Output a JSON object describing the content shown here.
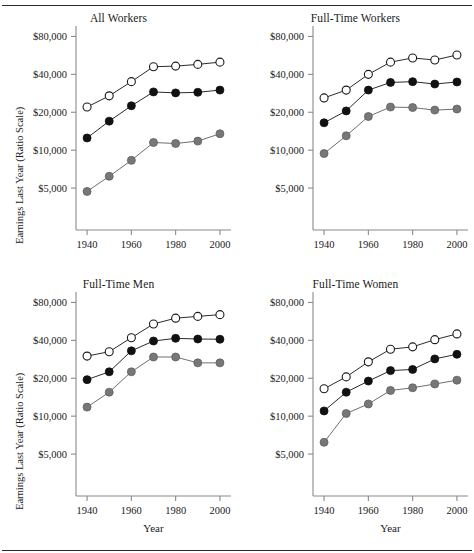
{
  "figure": {
    "ylabel": "Earnings Last Year (Ratio Scale)",
    "xlabel": "Year"
  },
  "chart_data": [
    {
      "type": "line",
      "panel": "top-left",
      "title": "All Workers",
      "xlabel": "",
      "ylabel": "Earnings Last Year (Ratio Scale)",
      "scale": "log",
      "grid": false,
      "legend": "none",
      "x": [
        1940,
        1950,
        1960,
        1970,
        1980,
        1990,
        2000
      ],
      "xlim": [
        1935,
        2005
      ],
      "xticks": [
        1940,
        1960,
        1980,
        2000
      ],
      "xticklabels": [
        "1940",
        "1960",
        "1980",
        "2000"
      ],
      "ylim": [
        3000,
        90000
      ],
      "yticks": [
        5000,
        10000,
        20000,
        40000,
        80000
      ],
      "yticklabels": [
        "$5,000",
        "$10,000",
        "$20,000",
        "$40,000",
        "$80,000"
      ],
      "series": [
        {
          "name": "upper",
          "marker": "open-circle",
          "color": "#1a1a1a",
          "fill": "#ffffff",
          "values": [
            22000,
            27000,
            35000,
            46000,
            46500,
            48000,
            50000
          ]
        },
        {
          "name": "middle",
          "marker": "filled-circle",
          "color": "#111111",
          "fill": "#111111",
          "values": [
            12500,
            17000,
            22500,
            29000,
            28500,
            28800,
            30000
          ]
        },
        {
          "name": "lower",
          "marker": "gray-circle",
          "color": "#777777",
          "fill": "#777777",
          "values": [
            4700,
            6200,
            8300,
            11500,
            11300,
            11800,
            13500
          ]
        }
      ]
    },
    {
      "type": "line",
      "panel": "top-right",
      "title": "Full-Time Workers",
      "xlabel": "",
      "ylabel": "",
      "scale": "log",
      "grid": false,
      "legend": "none",
      "x": [
        1940,
        1950,
        1960,
        1970,
        1980,
        1990,
        2000
      ],
      "xlim": [
        1935,
        2005
      ],
      "xticks": [
        1940,
        1960,
        1980,
        2000
      ],
      "xticklabels": [
        "1940",
        "1960",
        "1980",
        "2000"
      ],
      "ylim": [
        3000,
        90000
      ],
      "yticks": [
        5000,
        10000,
        20000,
        40000,
        80000
      ],
      "yticklabels": [
        "$5,000",
        "$10,000",
        "$20,000",
        "$40,000",
        "$80,000"
      ],
      "series": [
        {
          "name": "upper",
          "marker": "open-circle",
          "color": "#1a1a1a",
          "fill": "#ffffff",
          "values": [
            26000,
            30000,
            40000,
            50000,
            54000,
            52000,
            57000
          ]
        },
        {
          "name": "middle",
          "marker": "filled-circle",
          "color": "#111111",
          "fill": "#111111",
          "values": [
            16500,
            20500,
            30000,
            34500,
            35000,
            33500,
            34800
          ]
        },
        {
          "name": "lower",
          "marker": "gray-circle",
          "color": "#777777",
          "fill": "#777777",
          "values": [
            9400,
            13000,
            18500,
            22000,
            21800,
            20800,
            21200
          ]
        }
      ]
    },
    {
      "type": "line",
      "panel": "bottom-left",
      "title": "Full-Time Men",
      "xlabel": "Year",
      "ylabel": "Earnings Last Year (Ratio Scale)",
      "scale": "log",
      "grid": false,
      "legend": "none",
      "x": [
        1940,
        1950,
        1960,
        1970,
        1980,
        1990,
        2000
      ],
      "xlim": [
        1935,
        2005
      ],
      "xticks": [
        1940,
        1960,
        1980,
        2000
      ],
      "xticklabels": [
        "1940",
        "1960",
        "1980",
        "2000"
      ],
      "ylim": [
        3000,
        90000
      ],
      "yticks": [
        5000,
        10000,
        20000,
        40000,
        80000
      ],
      "yticklabels": [
        "$5,000",
        "$10,000",
        "$20,000",
        "$40,000",
        "$80,000"
      ],
      "series": [
        {
          "name": "upper",
          "marker": "open-circle",
          "color": "#1a1a1a",
          "fill": "#ffffff",
          "values": [
            30000,
            32500,
            42000,
            54000,
            60000,
            62000,
            64000
          ]
        },
        {
          "name": "middle",
          "marker": "filled-circle",
          "color": "#111111",
          "fill": "#111111",
          "values": [
            19500,
            22500,
            33000,
            39500,
            41500,
            41000,
            40800
          ]
        },
        {
          "name": "lower",
          "marker": "gray-circle",
          "color": "#777777",
          "fill": "#777777",
          "values": [
            11800,
            15500,
            22500,
            29500,
            29500,
            26500,
            26500
          ]
        }
      ]
    },
    {
      "type": "line",
      "panel": "bottom-right",
      "title": "Full-Time Women",
      "xlabel": "Year",
      "ylabel": "",
      "scale": "log",
      "grid": false,
      "legend": "none",
      "x": [
        1940,
        1950,
        1960,
        1970,
        1980,
        1990,
        2000
      ],
      "xlim": [
        1935,
        2005
      ],
      "xticks": [
        1940,
        1960,
        1980,
        2000
      ],
      "xticklabels": [
        "1940",
        "1960",
        "1980",
        "2000"
      ],
      "ylim": [
        3000,
        90000
      ],
      "yticks": [
        5000,
        10000,
        20000,
        40000,
        80000
      ],
      "yticklabels": [
        "$5,000",
        "$10,000",
        "$20,000",
        "$40,000",
        "$80,000"
      ],
      "series": [
        {
          "name": "upper",
          "marker": "open-circle",
          "color": "#1a1a1a",
          "fill": "#ffffff",
          "values": [
            16500,
            20500,
            27000,
            34000,
            35500,
            40500,
            45000
          ]
        },
        {
          "name": "middle",
          "marker": "filled-circle",
          "color": "#111111",
          "fill": "#111111",
          "values": [
            11000,
            15500,
            19000,
            23000,
            23500,
            28500,
            31000
          ]
        },
        {
          "name": "lower",
          "marker": "gray-circle",
          "color": "#777777",
          "fill": "#777777",
          "values": [
            6200,
            10500,
            12500,
            16000,
            16800,
            18000,
            19300
          ]
        }
      ]
    }
  ]
}
